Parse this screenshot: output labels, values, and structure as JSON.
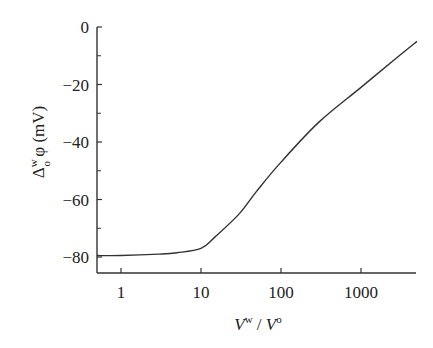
{
  "chart_data": {
    "type": "line",
    "title": "",
    "xlabel": "V^w / V^o",
    "ylabel": "Δ_o^w φ (mV)",
    "xscale": "log",
    "xlim": [
      0.5,
      5000
    ],
    "ylim": [
      -85,
      0
    ],
    "x_ticks": [
      1,
      10,
      100,
      1000
    ],
    "x_tick_labels": [
      "1",
      "10",
      "100",
      "1000"
    ],
    "y_ticks": [
      0,
      -20,
      -40,
      -60,
      -80
    ],
    "y_tick_labels": [
      "0",
      "−20",
      "−40",
      "−60",
      "−80"
    ],
    "y_minor_ticks": [
      -10,
      -30,
      -50,
      -70
    ],
    "grid": false,
    "legend": null,
    "series": [
      {
        "name": "potential",
        "x": [
          0.5,
          1,
          3,
          5,
          10,
          15,
          30,
          50,
          100,
          300,
          1000,
          3000,
          5000
        ],
        "y": [
          -79.5,
          -79.5,
          -79,
          -78.5,
          -77,
          -73,
          -65,
          -57,
          -47,
          -33,
          -21,
          -10,
          -5
        ]
      }
    ]
  },
  "labels": {
    "xlabel_V": "V",
    "xlabel_w": "w",
    "xlabel_slash": " / ",
    "xlabel_o": "o",
    "ylabel_delta": "Δ",
    "ylabel_sup": "w",
    "ylabel_sub": "o",
    "ylabel_rest": " φ (mV)"
  }
}
